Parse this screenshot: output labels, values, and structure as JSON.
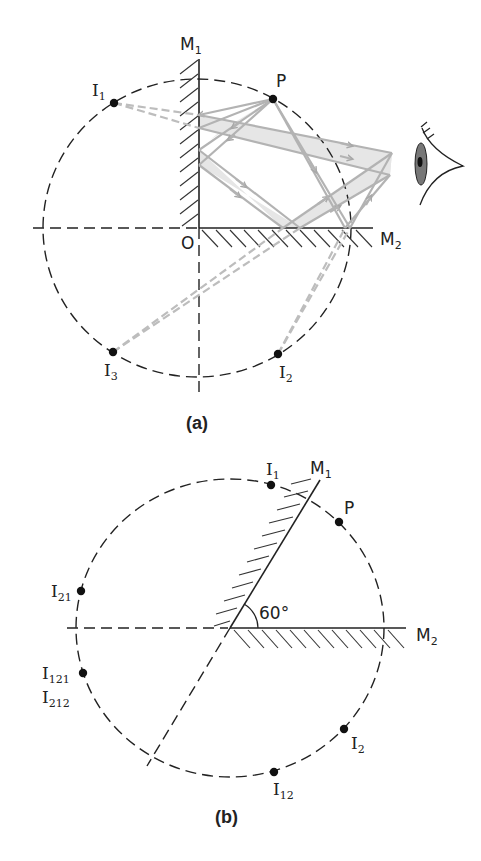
{
  "figure_a": {
    "caption": "(a)",
    "mirror_1_label": "M",
    "mirror_1_sub": "1",
    "mirror_2_label": "M",
    "mirror_2_sub": "2",
    "origin_label": "O",
    "object_label": "P",
    "images": [
      {
        "label": "I",
        "sub": "1"
      },
      {
        "label": "I",
        "sub": "2"
      },
      {
        "label": "I",
        "sub": "3"
      }
    ],
    "mirror_angle": "90°",
    "observer": "eye-icon"
  },
  "figure_b": {
    "caption": "(b)",
    "mirror_1_label": "M",
    "mirror_1_sub": "1",
    "mirror_2_label": "M",
    "mirror_2_sub": "2",
    "object_label": "P",
    "angle_label": "60°",
    "images": [
      {
        "label": "I",
        "sub": "1"
      },
      {
        "label": "I",
        "sub": "21"
      },
      {
        "label": "I",
        "sub": "121"
      },
      {
        "label": "I",
        "sub": "212"
      },
      {
        "label": "I",
        "sub": "2"
      },
      {
        "label": "I",
        "sub": "12"
      }
    ]
  },
  "colors": {
    "line": "#222222",
    "ray": "#b3b3b3",
    "band": "#e6e6e6"
  }
}
